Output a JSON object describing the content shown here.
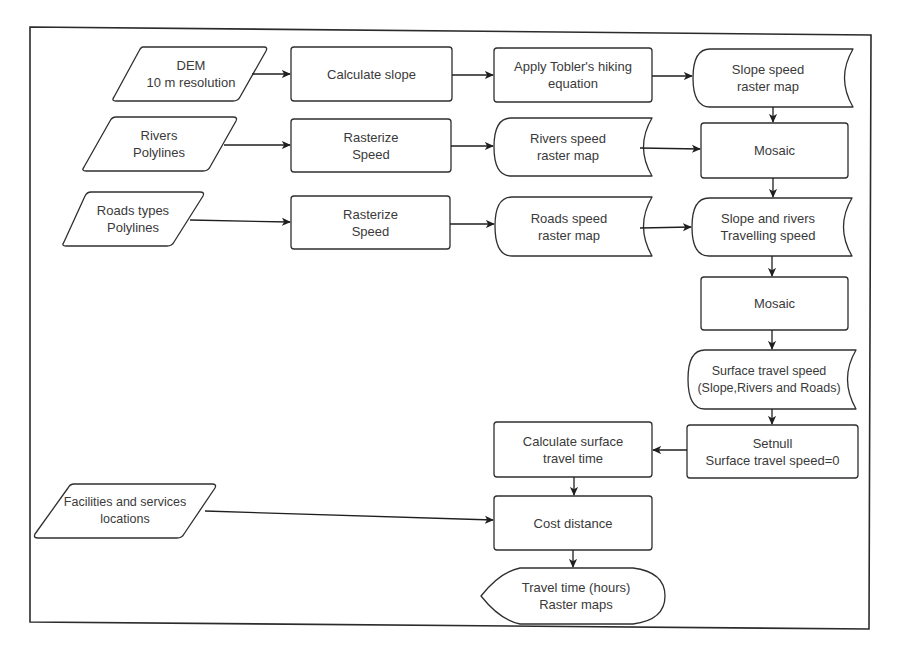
{
  "diagram": {
    "type": "flowchart",
    "colors": {
      "stroke": "#2b2b2b",
      "text": "#3a3a3a",
      "background": "#ffffff"
    },
    "nodes": [
      {
        "id": "dem",
        "shape": "parallelogram",
        "lines": [
          "DEM",
          "10 m resolution"
        ]
      },
      {
        "id": "rivers",
        "shape": "parallelogram",
        "lines": [
          "Rivers",
          "Polylines"
        ]
      },
      {
        "id": "roads",
        "shape": "parallelogram",
        "lines": [
          "Roads types",
          "Polylines"
        ]
      },
      {
        "id": "facilities",
        "shape": "parallelogram",
        "lines": [
          "Facilities and services",
          "locations"
        ]
      },
      {
        "id": "calc_slope",
        "shape": "process",
        "lines": [
          "Calculate slope"
        ]
      },
      {
        "id": "rasterize_rivers",
        "shape": "process",
        "lines": [
          "Rasterize",
          "Speed"
        ]
      },
      {
        "id": "rasterize_roads",
        "shape": "process",
        "lines": [
          "Rasterize",
          "Speed"
        ]
      },
      {
        "id": "tobler",
        "shape": "process",
        "lines": [
          "Apply Tobler's hiking",
          "equation"
        ]
      },
      {
        "id": "rivers_speed",
        "shape": "stored-data",
        "lines": [
          "Rivers speed",
          "raster map"
        ]
      },
      {
        "id": "roads_speed",
        "shape": "stored-data",
        "lines": [
          "Roads speed",
          "raster map"
        ]
      },
      {
        "id": "slope_speed",
        "shape": "stored-data",
        "lines": [
          "Slope speed",
          "raster map"
        ]
      },
      {
        "id": "mosaic1",
        "shape": "process",
        "lines": [
          "Mosaic"
        ]
      },
      {
        "id": "slope_rivers",
        "shape": "stored-data",
        "lines": [
          "Slope and rivers",
          "Travelling speed"
        ]
      },
      {
        "id": "mosaic2",
        "shape": "process",
        "lines": [
          "Mosaic"
        ]
      },
      {
        "id": "surface_speed",
        "shape": "stored-data",
        "lines": [
          "Surface travel speed",
          "(Slope,Rivers and Roads)"
        ]
      },
      {
        "id": "setnull",
        "shape": "process",
        "lines": [
          "Setnull",
          "Surface travel speed=0"
        ]
      },
      {
        "id": "calc_time",
        "shape": "process",
        "lines": [
          "Calculate surface",
          "travel time"
        ]
      },
      {
        "id": "cost_distance",
        "shape": "process",
        "lines": [
          "Cost distance"
        ]
      },
      {
        "id": "travel_time",
        "shape": "display",
        "lines": [
          "Travel time (hours)",
          "Raster maps"
        ]
      }
    ],
    "edges": [
      [
        "dem",
        "calc_slope"
      ],
      [
        "calc_slope",
        "tobler"
      ],
      [
        "tobler",
        "slope_speed"
      ],
      [
        "rivers",
        "rasterize_rivers"
      ],
      [
        "rasterize_rivers",
        "rivers_speed"
      ],
      [
        "rivers_speed",
        "mosaic1"
      ],
      [
        "slope_speed",
        "mosaic1"
      ],
      [
        "roads",
        "rasterize_roads"
      ],
      [
        "rasterize_roads",
        "roads_speed"
      ],
      [
        "roads_speed",
        "slope_rivers"
      ],
      [
        "mosaic1",
        "slope_rivers"
      ],
      [
        "slope_rivers",
        "mosaic2"
      ],
      [
        "mosaic2",
        "surface_speed"
      ],
      [
        "surface_speed",
        "setnull"
      ],
      [
        "setnull",
        "calc_time"
      ],
      [
        "calc_time",
        "cost_distance"
      ],
      [
        "facilities",
        "cost_distance"
      ],
      [
        "cost_distance",
        "travel_time"
      ]
    ]
  }
}
